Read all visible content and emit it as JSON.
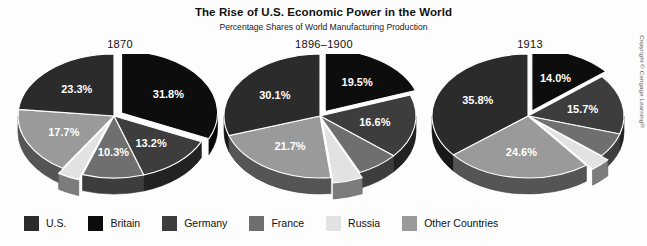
{
  "header": {
    "title": "The Rise of U.S. Economic Power in the World",
    "subtitle": "Percentage Shares of World Manufacturing Production"
  },
  "copyright": "Copyright © Cengage Learning®",
  "legend": {
    "position": "bottom",
    "items": [
      {
        "label": "U.S.",
        "color": "#2b2b2b"
      },
      {
        "label": "Britain",
        "color": "#0d0d0d"
      },
      {
        "label": "Germany",
        "color": "#3d3d3d"
      },
      {
        "label": "France",
        "color": "#6f6f6f"
      },
      {
        "label": "Russia",
        "color": "#e2e2e2"
      },
      {
        "label": "Other Countries",
        "color": "#9a9a9a"
      }
    ]
  },
  "charts": [
    {
      "year": "1870"
    },
    {
      "year": "1896–1900"
    },
    {
      "year": "1913"
    }
  ],
  "chart_data": [
    {
      "type": "pie",
      "title": "1870",
      "categories": [
        "U.S.",
        "Britain",
        "Germany",
        "France",
        "Russia",
        "Other Countries"
      ],
      "values": [
        23.3,
        31.8,
        13.2,
        10.3,
        3.7,
        17.7
      ],
      "labels": [
        "23.3%",
        "31.8%",
        "13.2%",
        "10.3%",
        "3.7%",
        "17.7%"
      ],
      "colors": [
        "#2b2b2b",
        "#0d0d0d",
        "#3d3d3d",
        "#6f6f6f",
        "#e2e2e2",
        "#9a9a9a"
      ],
      "exploded": [
        "Britain",
        "Russia"
      ],
      "label_placement": [
        "inside",
        "inside",
        "inside",
        "inside",
        "outside",
        "inside"
      ],
      "unit": "percent",
      "ylabel": "",
      "xlabel": ""
    },
    {
      "type": "pie",
      "title": "1896–1900",
      "categories": [
        "U.S.",
        "Britain",
        "Germany",
        "France",
        "Russia",
        "Other Countries"
      ],
      "values": [
        30.1,
        19.5,
        16.6,
        7.1,
        5.0,
        21.7
      ],
      "labels": [
        "30.1%",
        "19.5%",
        "16.6%",
        "7.1%",
        "5.0%",
        "21.7%"
      ],
      "colors": [
        "#2b2b2b",
        "#0d0d0d",
        "#3d3d3d",
        "#6f6f6f",
        "#e2e2e2",
        "#9a9a9a"
      ],
      "exploded": [
        "Britain",
        "Russia"
      ],
      "label_placement": [
        "inside",
        "inside",
        "inside",
        "outside",
        "outside",
        "inside"
      ],
      "unit": "percent",
      "ylabel": "",
      "xlabel": ""
    },
    {
      "type": "pie",
      "title": "1913",
      "categories": [
        "U.S.",
        "Britain",
        "Germany",
        "France",
        "Russia",
        "Other Countries"
      ],
      "values": [
        35.8,
        14.0,
        15.7,
        6.4,
        3.5,
        24.6
      ],
      "labels": [
        "35.8%",
        "14.0%",
        "15.7%",
        "6.4%",
        "3.5%",
        "24.6%"
      ],
      "colors": [
        "#2b2b2b",
        "#0d0d0d",
        "#3d3d3d",
        "#6f6f6f",
        "#e2e2e2",
        "#9a9a9a"
      ],
      "exploded": [
        "Britain",
        "Russia"
      ],
      "label_placement": [
        "inside",
        "inside",
        "inside",
        "outside",
        "outside",
        "inside"
      ],
      "unit": "percent",
      "ylabel": "",
      "xlabel": ""
    }
  ]
}
